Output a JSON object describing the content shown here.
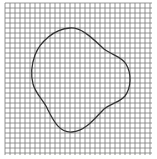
{
  "figure": {
    "width": 157,
    "height": 159,
    "background": "#ffffff"
  },
  "grid": {
    "x0": 5,
    "y0": 3,
    "x1": 152,
    "y1": 155,
    "spacing": 5,
    "line_color": "#7a7a7a",
    "line_width": 0.8
  },
  "curve": {
    "stroke": "#333333",
    "stroke_width": 1.3,
    "path": "M 70 28 C 82 27, 94 40, 104 49 C 112 55, 122 57, 126 64 C 132 74, 131 88, 125 96 C 120 102, 112 103, 104 109 C 96 117, 86 131, 72 132 C 60 133, 54 122, 48 110 C 44 100, 36 95, 33 84 C 31 76, 31 66, 35 55 C 40 42, 54 29, 70 28 Z"
  }
}
